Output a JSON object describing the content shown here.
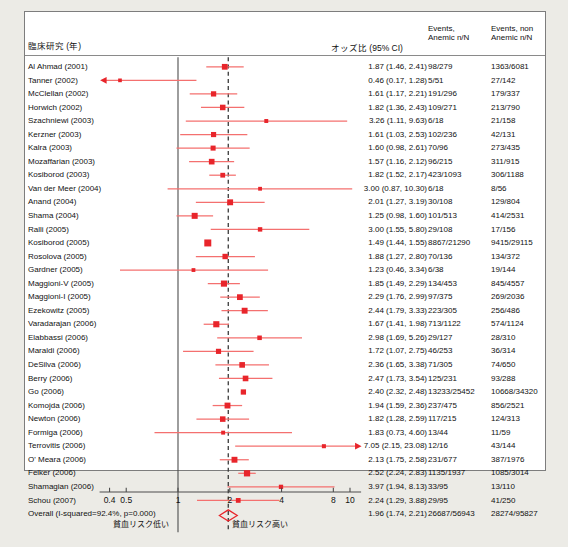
{
  "headers": {
    "study": "臨床研究 (年)",
    "odds_ratio": "オッズ比 (95% CI)",
    "events_anemic_l1": "Events,",
    "events_anemic_l2": "Anemic n/N",
    "events_nonanemic_l1": "Events, non",
    "events_nonanemic_l2": "Anemic n/N"
  },
  "axis": {
    "ticks": [
      {
        "label": "0.4",
        "value": 0.4
      },
      {
        "label": "0.5",
        "value": 0.5
      },
      {
        "label": "1",
        "value": 1
      },
      {
        "label": "2",
        "value": 2
      },
      {
        "label": "4",
        "value": 4
      },
      {
        "label": "8",
        "value": 8
      },
      {
        "label": "10",
        "value": 10
      }
    ],
    "scale": "log",
    "null_value": 1,
    "pooled_line_value": 1.96
  },
  "footer": {
    "left_label": "貧血リスク低い",
    "right_label": "貧血リスク高い"
  },
  "colors": {
    "marker": "#e8252b",
    "ci_line": "#f4706f",
    "null_line": "#4d4d4d",
    "pooled_dashed": "#3a3a3a",
    "diamond": "#e8252b",
    "panel_bg": "#ffffff",
    "page_bg": "#ecebe6"
  },
  "chart_data": {
    "type": "forest",
    "title": "",
    "xlabel": "",
    "ylabel": "",
    "xlim": [
      0.35,
      11.5
    ],
    "xscale": "log",
    "effect_measure": "Odds Ratio (95% CI)",
    "heterogeneity": "I-squared=92.4%, p=0.000",
    "studies": [
      {
        "name": "Al Ahmad (2001)",
        "or": 1.87,
        "lo": 1.46,
        "hi": 2.41,
        "or_text": "1.87 (1.46, 2.41)",
        "anemic": "98/279",
        "nonanemic": "1363/6081",
        "weight": 3.0
      },
      {
        "name": "Tanner (2002)",
        "or": 0.46,
        "lo": 0.17,
        "hi": 1.28,
        "or_text": "0.46 (0.17, 1.28)",
        "anemic": "5/51",
        "nonanemic": "27/142",
        "weight": 1.3
      },
      {
        "name": "McClellan (2002)",
        "or": 1.61,
        "lo": 1.17,
        "hi": 2.21,
        "or_text": "1.61 (1.17, 2.21)",
        "anemic": "191/296",
        "nonanemic": "179/337",
        "weight": 2.6
      },
      {
        "name": "Horwich (2002)",
        "or": 1.82,
        "lo": 1.36,
        "hi": 2.43,
        "or_text": "1.82 (1.36, 2.43)",
        "anemic": "109/271",
        "nonanemic": "213/790",
        "weight": 2.8
      },
      {
        "name": "Szachniewi (2003)",
        "or": 3.26,
        "lo": 1.11,
        "hi": 9.63,
        "or_text": "3.26 (1.11, 9.63)",
        "anemic": "6/18",
        "nonanemic": "21/158",
        "weight": 1.5
      },
      {
        "name": "Kerzner (2003)",
        "or": 1.61,
        "lo": 1.03,
        "hi": 2.53,
        "or_text": "1.61 (1.03, 2.53)",
        "anemic": "102/236",
        "nonanemic": "42/131",
        "weight": 2.5
      },
      {
        "name": "Kalra (2003)",
        "or": 1.6,
        "lo": 0.98,
        "hi": 2.61,
        "or_text": "1.60 (0.98, 2.61)",
        "anemic": "70/96",
        "nonanemic": "273/435",
        "weight": 2.4
      },
      {
        "name": "Mozaffarian (2003)",
        "or": 1.57,
        "lo": 1.16,
        "hi": 2.12,
        "or_text": "1.57 (1.16, 2.12)",
        "anemic": "96/215",
        "nonanemic": "311/915",
        "weight": 2.9
      },
      {
        "name": "Kosiborod (2003)",
        "or": 1.82,
        "lo": 1.52,
        "hi": 2.17,
        "or_text": "1.82 (1.52, 2.17)",
        "anemic": "423/1093",
        "nonanemic": "306/1188",
        "weight": 2.2
      },
      {
        "name": "Van der Meer (2004)",
        "or": 3.0,
        "lo": 0.87,
        "hi": 10.3,
        "or_text": "3.00 (0.87, 10.30)",
        "anemic": "6/18",
        "nonanemic": "8/56",
        "weight": 1.4
      },
      {
        "name": "Anand (2004)",
        "or": 2.01,
        "lo": 1.27,
        "hi": 3.19,
        "or_text": "2.01 (1.27, 3.19)",
        "anemic": "30/108",
        "nonanemic": "129/804",
        "weight": 3.1
      },
      {
        "name": "Shama (2004)",
        "or": 1.25,
        "lo": 0.98,
        "hi": 1.6,
        "or_text": "1.25 (0.98, 1.60)",
        "anemic": "101/513",
        "nonanemic": "414/2531",
        "weight": 3.2
      },
      {
        "name": "Ralli (2005)",
        "or": 3.0,
        "lo": 1.55,
        "hi": 5.8,
        "or_text": "3.00 (1.55, 5.80)",
        "anemic": "29/108",
        "nonanemic": "17/156",
        "weight": 1.9
      },
      {
        "name": "Kosiborod (2005)",
        "or": 1.49,
        "lo": 1.44,
        "hi": 1.55,
        "or_text": "1.49 (1.44, 1.55)",
        "anemic": "8867/21290",
        "nonanemic": "9415/29115",
        "weight": 4.0
      },
      {
        "name": "Rosolova (2005)",
        "or": 1.88,
        "lo": 1.27,
        "hi": 2.8,
        "or_text": "1.88 (1.27, 2.80)",
        "anemic": "70/136",
        "nonanemic": "134/372",
        "weight": 2.7
      },
      {
        "name": "Gardner (2005)",
        "or": 1.23,
        "lo": 0.46,
        "hi": 3.34,
        "or_text": "1.23 (0.46, 3.34)",
        "anemic": "6/38",
        "nonanemic": "19/144",
        "weight": 1.4
      },
      {
        "name": "Maggioni-V (2005)",
        "or": 1.85,
        "lo": 1.49,
        "hi": 2.29,
        "or_text": "1.85 (1.49, 2.29)",
        "anemic": "134/453",
        "nonanemic": "845/4557",
        "weight": 3.3
      },
      {
        "name": "Maggioni-I (2005)",
        "or": 2.29,
        "lo": 1.76,
        "hi": 2.99,
        "or_text": "2.29 (1.76, 2.99)",
        "anemic": "97/375",
        "nonanemic": "269/2036",
        "weight": 3.0
      },
      {
        "name": "Ezekowitz (2005)",
        "or": 2.44,
        "lo": 1.79,
        "hi": 3.33,
        "or_text": "2.44 (1.79, 3.33)",
        "anemic": "223/305",
        "nonanemic": "256/486",
        "weight": 3.1
      },
      {
        "name": "Varadarajan (2006)",
        "or": 1.67,
        "lo": 1.41,
        "hi": 1.98,
        "or_text": "1.67 (1.41, 1.98)",
        "anemic": "713/1122",
        "nonanemic": "574/1124",
        "weight": 3.3
      },
      {
        "name": "Elabbassi (2006)",
        "or": 2.98,
        "lo": 1.69,
        "hi": 5.26,
        "or_text": "2.98 (1.69, 5.26)",
        "anemic": "29/127",
        "nonanemic": "28/310",
        "weight": 2.0
      },
      {
        "name": "Maraldi (2006)",
        "or": 1.72,
        "lo": 1.07,
        "hi": 2.75,
        "or_text": "1.72 (1.07, 2.75)",
        "anemic": "46/253",
        "nonanemic": "36/314",
        "weight": 2.5
      },
      {
        "name": "DeSilva (2006)",
        "or": 2.36,
        "lo": 1.65,
        "hi": 3.38,
        "or_text": "2.36 (1.65, 3.38)",
        "anemic": "71/305",
        "nonanemic": "74/650",
        "weight": 2.9
      },
      {
        "name": "Berry (2006)",
        "or": 2.47,
        "lo": 1.73,
        "hi": 3.54,
        "or_text": "2.47 (1.73, 3.54)",
        "anemic": "125/231",
        "nonanemic": "93/288",
        "weight": 2.9
      },
      {
        "name": "Go (2006)",
        "or": 2.4,
        "lo": 2.32,
        "hi": 2.48,
        "or_text": "2.40 (2.32, 2.48)",
        "anemic": "13233/25452",
        "nonanemic": "10668/34320",
        "weight": 2.6
      },
      {
        "name": "Komojda (2006)",
        "or": 1.94,
        "lo": 1.59,
        "hi": 2.36,
        "or_text": "1.94 (1.59, 2.36)",
        "anemic": "237/475",
        "nonanemic": "856/2521",
        "weight": 3.1
      },
      {
        "name": "Newton (2006)",
        "or": 1.82,
        "lo": 1.28,
        "hi": 2.59,
        "or_text": "1.82 (1.28, 2.59)",
        "anemic": "117/215",
        "nonanemic": "124/313",
        "weight": 2.8
      },
      {
        "name": "Formiga (2006)",
        "or": 1.83,
        "lo": 0.73,
        "hi": 4.6,
        "or_text": "1.83 (0.73, 4.60)",
        "anemic": "13/44",
        "nonanemic": "11/59",
        "weight": 1.5
      },
      {
        "name": "Terrovitis (2006)",
        "or": 7.05,
        "lo": 2.15,
        "hi": 23.08,
        "or_text": "7.05 (2.15, 23.08)",
        "anemic": "12/16",
        "nonanemic": "43/144",
        "weight": 1.6
      },
      {
        "name": "O' Meara (2006)",
        "or": 2.13,
        "lo": 1.75,
        "hi": 2.58,
        "or_text": "2.13 (1.75, 2.58)",
        "anemic": "231/677",
        "nonanemic": "387/1976",
        "weight": 3.1
      },
      {
        "name": "Felker (2006)",
        "or": 2.52,
        "lo": 2.24,
        "hi": 2.83,
        "or_text": "2.52 (2.24, 2.83)",
        "anemic": "1135/1937",
        "nonanemic": "1085/3014",
        "weight": 3.4
      },
      {
        "name": "Shamagian (2006)",
        "or": 3.97,
        "lo": 1.94,
        "hi": 8.13,
        "or_text": "3.97 (1.94, 8.13)",
        "anemic": "33/95",
        "nonanemic": "13/110",
        "weight": 1.8
      },
      {
        "name": "Schou (2007)",
        "or": 2.24,
        "lo": 1.29,
        "hi": 3.88,
        "or_text": "2.24 (1.29, 3.88)",
        "anemic": "29/95",
        "nonanemic": "41/250",
        "weight": 2.2
      }
    ],
    "overall": {
      "name": "Overall (I-squared=92.4%, p=0.000)",
      "or": 1.96,
      "lo": 1.74,
      "hi": 2.21,
      "or_text": "1.96 (1.74, 2.21)",
      "anemic": "26687/56943",
      "nonanemic": "28274/95827"
    }
  }
}
